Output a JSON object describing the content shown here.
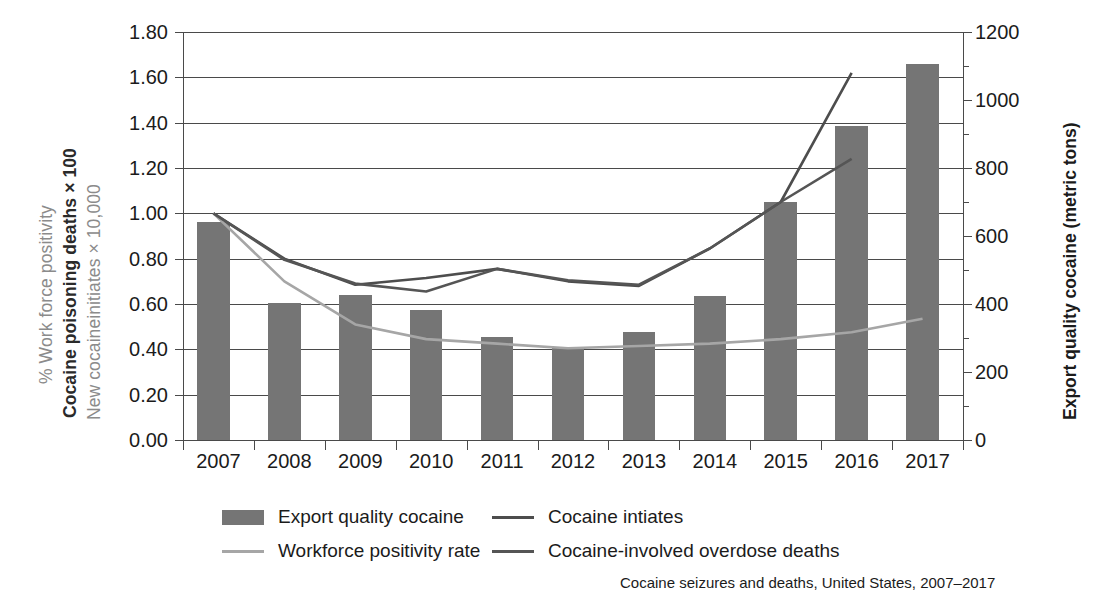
{
  "axes": {
    "left_titles": [
      "% Work force positivity",
      "Cocaine poisoning deaths × 100",
      "New cocaineinitiates × 10,000"
    ],
    "right_title": "Export quality cocaine (metric tons)",
    "left_ticks": [
      "1.80",
      "1.60",
      "1.40",
      "1.20",
      "1.00",
      "0.80",
      "0.60",
      "0.40",
      "0.20",
      "0.00"
    ],
    "right_ticks": [
      "1200",
      "1000",
      "800",
      "600",
      "400",
      "200",
      "0"
    ],
    "x_ticks": [
      "2007",
      "2008",
      "2009",
      "2010",
      "2011",
      "2012",
      "2013",
      "2014",
      "2015",
      "2016",
      "2017"
    ]
  },
  "legend": {
    "items": [
      {
        "label": "Export quality cocaine",
        "type": "bar",
        "color": "#757575"
      },
      {
        "label": "Cocaine intiates",
        "type": "line",
        "color": "#4d4d4d"
      },
      {
        "label": "Workforce positivity rate",
        "type": "line",
        "color": "#a6a6a6"
      },
      {
        "label": "Cocaine-involved overdose deaths",
        "type": "line",
        "color": "#555555"
      }
    ]
  },
  "caption": "Cocaine seizures and deaths, United States, 2007–2017",
  "colors": {
    "bar": "#757575",
    "initiates_line": "#4d4d4d",
    "workforce_line": "#a6a6a6",
    "overdose_line": "#555555",
    "axis": "#4a4a4a",
    "text": "#1b1b1b",
    "muted_text": "#8b8b8b"
  },
  "chart_data": {
    "type": "bar",
    "title": "",
    "xlabel": "",
    "ylabel": "% Work force positivity / Cocaine poisoning deaths × 100 / New cocaineinitiates × 10,000",
    "y2label": "Export quality cocaine (metric tons)",
    "categories": [
      "2007",
      "2008",
      "2009",
      "2010",
      "2011",
      "2012",
      "2013",
      "2014",
      "2015",
      "2016",
      "2017"
    ],
    "ylim": [
      0,
      1.8
    ],
    "ytick_step": 0.2,
    "y2lim": [
      0,
      1200
    ],
    "y2tick_step": 200,
    "grid": true,
    "legend_position": "bottom",
    "series": [
      {
        "name": "Export quality cocaine",
        "type": "bar",
        "axis": "right",
        "unit": "metric tons",
        "color": "#757575",
        "values_left_scale": [
          0.96,
          0.605,
          0.64,
          0.575,
          0.455,
          0.41,
          0.475,
          0.635,
          1.05,
          1.385,
          1.66
        ],
        "values": [
          640,
          403,
          427,
          383,
          303,
          273,
          317,
          423,
          700,
          923,
          1107
        ]
      },
      {
        "name": "Cocaine intiates",
        "type": "line",
        "axis": "left",
        "color": "#4d4d4d",
        "x": [
          "2007",
          "2008",
          "2009",
          "2010",
          "2011",
          "2012",
          "2013",
          "2014",
          "2015",
          "2016"
        ],
        "values": [
          1.0,
          0.8,
          0.685,
          0.715,
          0.755,
          0.7,
          0.68,
          0.845,
          1.05,
          1.62
        ]
      },
      {
        "name": "Workforce positivity rate",
        "type": "line",
        "axis": "left",
        "color": "#a6a6a6",
        "x": [
          "2007",
          "2008",
          "2009",
          "2010",
          "2011",
          "2012",
          "2013",
          "2014",
          "2015",
          "2016",
          "2017"
        ],
        "values": [
          1.0,
          0.7,
          0.51,
          0.445,
          0.425,
          0.405,
          0.415,
          0.425,
          0.445,
          0.475,
          0.535
        ]
      },
      {
        "name": "Cocaine-involved overdose deaths",
        "type": "line",
        "axis": "left",
        "color": "#555555",
        "x": [
          "2007",
          "2008",
          "2009",
          "2010",
          "2011",
          "2012",
          "2013",
          "2014",
          "2015",
          "2016"
        ],
        "values": [
          1.0,
          0.795,
          0.69,
          0.655,
          0.755,
          0.705,
          0.685,
          0.845,
          1.05,
          1.24
        ]
      }
    ]
  }
}
